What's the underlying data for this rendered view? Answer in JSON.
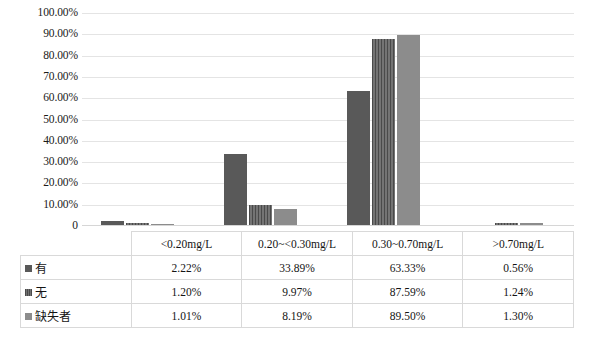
{
  "chart_data": {
    "type": "bar",
    "title": "",
    "xlabel": "",
    "ylabel": "",
    "ylim": [
      0,
      100
    ],
    "grid": true,
    "legend_position": "table-left",
    "categories": [
      "<0.20mg/L",
      "0.20~<0.30mg/L",
      "0.30~0.70mg/L",
      ">0.70mg/L"
    ],
    "series": [
      {
        "name": "有",
        "values": [
          2.22,
          33.89,
          63.33,
          0.56
        ],
        "labels": [
          "2.22%",
          "33.89%",
          "63.33%",
          "0.56%"
        ],
        "color": "#595959",
        "fill": "solid"
      },
      {
        "name": "无",
        "values": [
          1.2,
          9.97,
          87.59,
          1.24
        ],
        "labels": [
          "1.20%",
          "9.97%",
          "87.59%",
          "1.24%"
        ],
        "color": "#5e5e5e",
        "fill": "vertical-stripe"
      },
      {
        "name": "缺失者",
        "values": [
          1.01,
          8.19,
          89.5,
          1.3
        ],
        "labels": [
          "1.01%",
          "8.19%",
          "89.50%",
          "1.30%"
        ],
        "color": "#8c8c8c",
        "fill": "solid"
      }
    ],
    "yticks": [
      "100.00%",
      "90.00%",
      "80.00%",
      "70.00%",
      "60.00%",
      "50.00%",
      "40.00%",
      "30.00%",
      "20.00%",
      "10.00%",
      "0"
    ],
    "ytick_values": [
      100,
      90,
      80,
      70,
      60,
      50,
      40,
      30,
      20,
      10,
      0
    ]
  },
  "table": {
    "corner_label": "",
    "headers": [
      "<0.20mg/L",
      "0.20~<0.30mg/L",
      "0.30~0.70mg/L",
      ">0.70mg/L"
    ],
    "rows": [
      {
        "label": "有",
        "cells": [
          "2.22%",
          "33.89%",
          "63.33%",
          "0.56%"
        ]
      },
      {
        "label": "无",
        "cells": [
          "1.20%",
          "9.97%",
          "87.59%",
          "1.24%"
        ]
      },
      {
        "label": "缺失者",
        "cells": [
          "1.01%",
          "8.19%",
          "89.50%",
          "1.30%"
        ]
      }
    ]
  },
  "caption": ""
}
